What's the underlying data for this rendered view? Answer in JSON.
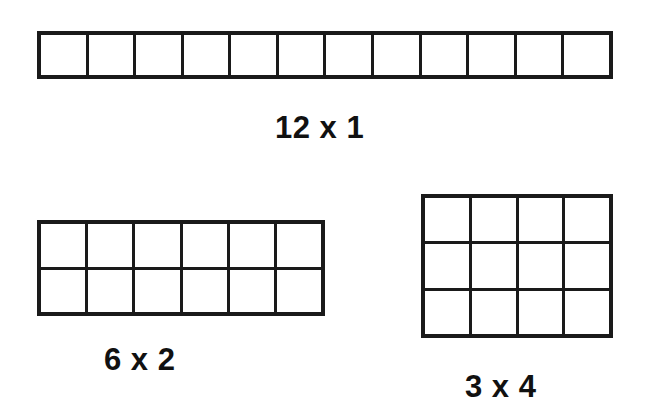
{
  "page": {
    "background_color": "#ffffff",
    "line_color": "#1a1a1a",
    "text_color": "#111111",
    "width": 646,
    "height": 411
  },
  "arrays": [
    {
      "id": "array-12x1",
      "label": "12 x 1",
      "rows": 1,
      "columns": 12,
      "total_cells": 12,
      "cell_size_px": 48,
      "position": {
        "left": 37,
        "top": 31,
        "width": 576,
        "height": 48
      },
      "label_position": {
        "left": 275,
        "top": 112,
        "font_size": 31
      }
    },
    {
      "id": "array-6x2",
      "label": "6 x 2",
      "rows": 2,
      "columns": 6,
      "total_cells": 12,
      "cell_size_px": 48,
      "position": {
        "left": 37,
        "top": 220,
        "width": 288,
        "height": 96
      },
      "label_position": {
        "left": 104,
        "top": 344,
        "font_size": 31
      }
    },
    {
      "id": "array-3x4",
      "label": "3 x 4",
      "rows": 3,
      "columns": 4,
      "total_cells": 12,
      "cell_size_px": 48,
      "position": {
        "left": 421,
        "top": 194,
        "width": 192,
        "height": 144
      },
      "label_position": {
        "left": 465,
        "top": 371,
        "font_size": 31
      }
    }
  ],
  "chart_data": {
    "type": "table",
    "xlabel": "",
    "ylabel": "",
    "categories": [
      "12 x 1",
      "6 x 2",
      "3 x 4"
    ],
    "values": [
      12,
      12,
      12
    ],
    "series": [
      {
        "name": "rows",
        "values": [
          1,
          2,
          3
        ]
      },
      {
        "name": "columns",
        "values": [
          12,
          6,
          4
        ]
      },
      {
        "name": "product",
        "values": [
          12,
          12,
          12
        ]
      }
    ],
    "annotations": [
      "12 x 1",
      "6 x 2",
      "3 x 4"
    ],
    "grid": true,
    "legend": "none"
  }
}
